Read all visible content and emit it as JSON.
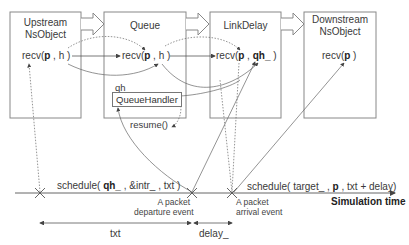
{
  "objects": [
    {
      "id": "upstream",
      "title_line1": "Upstream",
      "title_line2": "NsObject",
      "call": "recv(",
      "arg1": "p",
      "sep": " , ",
      "arg2": "h",
      "close": " )"
    },
    {
      "id": "queue",
      "title_line1": "Queue",
      "call": "recv(",
      "arg1": "p",
      "sep": " , ",
      "arg2": "h",
      "close": " )"
    },
    {
      "id": "linkdelay",
      "title_line1": "LinkDelay",
      "call": "recv(",
      "arg1": "p",
      "sep": " , ",
      "arg2": "qh_",
      "close": " )"
    },
    {
      "id": "downstream",
      "title_line1": "Downstream",
      "title_line2": "NsObject",
      "call": "recv(",
      "arg1": "p",
      "close": " )"
    }
  ],
  "queue_handler": {
    "var_label": "qh_",
    "box_label": "QueueHandler",
    "resume_label": "resume()"
  },
  "timeline": {
    "schedule1_prefix": "schedule(",
    "schedule1_bold": " qh_",
    "schedule1_suffix": " , &intr_ , txt )",
    "schedule2_prefix": "schedule( target_ , ",
    "schedule2_bold": "p",
    "schedule2_suffix": " , txt + delay)",
    "axis_label": "Simulation time",
    "departure_line1": "A packet",
    "departure_line2": "departure event",
    "arrival_line1": "A packet",
    "arrival_line2": "arrival event",
    "interval_txt": "txt",
    "interval_delay": "delay_"
  },
  "colors": {
    "stroke": "#666666",
    "box_border": "#888888",
    "text": "#333333"
  }
}
